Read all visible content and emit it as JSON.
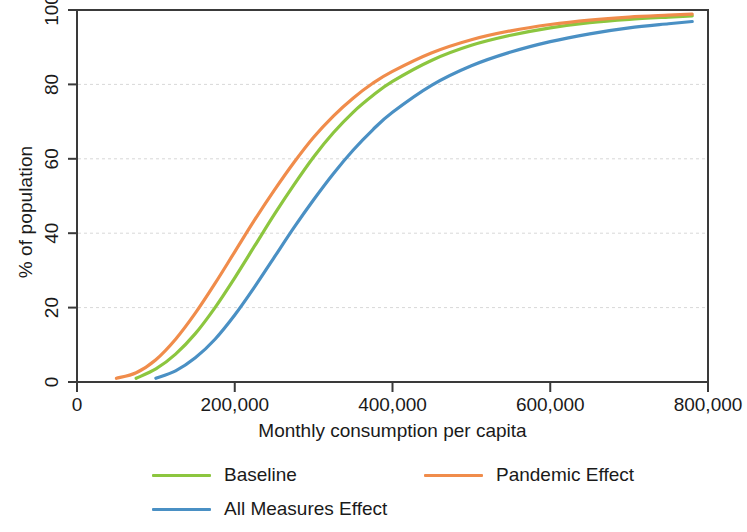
{
  "chart_data": {
    "type": "line",
    "title": "",
    "subtitle": "",
    "xlabel": "Monthly consumption per capita",
    "ylabel": "% of population",
    "xlim": [
      0,
      800000
    ],
    "ylim": [
      0,
      100
    ],
    "xticks": [
      "0",
      "200,000",
      "400,000",
      "600,000",
      "800,000"
    ],
    "xtick_values": [
      0,
      200000,
      400000,
      600000,
      800000
    ],
    "yticks": [
      "0",
      "20",
      "40",
      "60",
      "80",
      "100"
    ],
    "ytick_values": [
      0,
      20,
      40,
      60,
      80,
      100
    ],
    "grid": "horizontal",
    "legend_position": "bottom",
    "x": [
      50000,
      75000,
      100000,
      125000,
      150000,
      175000,
      200000,
      225000,
      250000,
      275000,
      300000,
      325000,
      350000,
      375000,
      400000,
      450000,
      500000,
      550000,
      600000,
      650000,
      700000,
      750000,
      780000
    ],
    "series": [
      {
        "name": "Baseline",
        "color": "#8CC63F",
        "values": [
          0.0,
          1.0,
          3.5,
          7.5,
          13.0,
          20.0,
          28.0,
          36.5,
          45.0,
          53.0,
          60.5,
          67.0,
          72.5,
          77.0,
          80.8,
          86.5,
          90.5,
          93.2,
          95.2,
          96.6,
          97.5,
          98.1,
          98.4
        ]
      },
      {
        "name": "Pandemic Effect",
        "color": "#F08C4B",
        "values": [
          1.0,
          2.5,
          6.0,
          11.5,
          18.5,
          26.5,
          35.0,
          43.5,
          51.5,
          59.0,
          65.8,
          71.5,
          76.3,
          80.3,
          83.5,
          88.5,
          92.0,
          94.4,
          96.1,
          97.3,
          98.1,
          98.6,
          98.9
        ]
      },
      {
        "name": "All Measures Effect",
        "color": "#4A90C4",
        "values": [
          0.0,
          0.0,
          1.0,
          3.0,
          6.5,
          11.5,
          18.0,
          25.5,
          33.5,
          41.5,
          49.0,
          56.0,
          62.3,
          67.8,
          72.5,
          79.8,
          85.0,
          88.7,
          91.5,
          93.6,
          95.2,
          96.3,
          96.9
        ]
      }
    ]
  },
  "axes": {
    "y_title": "% of population",
    "x_title": "Monthly consumption per capita"
  },
  "legend": {
    "items": [
      {
        "label": "Baseline",
        "color": "#8CC63F"
      },
      {
        "label": "Pandemic Effect",
        "color": "#F08C4B"
      },
      {
        "label": "All Measures Effect",
        "color": "#4A90C4"
      }
    ]
  },
  "style": {
    "frame_color": "#3a3a3a",
    "grid_color": "#d8d8d8",
    "text_color": "#1a1a1a",
    "background": "#ffffff"
  }
}
